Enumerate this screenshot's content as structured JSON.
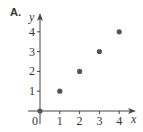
{
  "panel_label": "A.",
  "chart_data": {
    "type": "scatter",
    "title": "",
    "xlabel": "x",
    "ylabel": "y",
    "x": [
      0,
      1,
      2,
      3,
      4
    ],
    "y": [
      0,
      1,
      2,
      3,
      4
    ],
    "points": [
      {
        "x": 0,
        "y": 0
      },
      {
        "x": 1,
        "y": 1
      },
      {
        "x": 2,
        "y": 2
      },
      {
        "x": 3,
        "y": 3
      },
      {
        "x": 4,
        "y": 4
      }
    ],
    "x_ticks": [
      "1",
      "2",
      "3",
      "4"
    ],
    "y_ticks": [
      "1",
      "2",
      "3",
      "4"
    ],
    "origin_label": "0",
    "xlim": [
      0,
      4.8
    ],
    "ylim": [
      0,
      4.8
    ],
    "grid": false,
    "legend": null
  },
  "colors": {
    "point": "#555555",
    "axis": "#444444",
    "text": "#333333"
  }
}
